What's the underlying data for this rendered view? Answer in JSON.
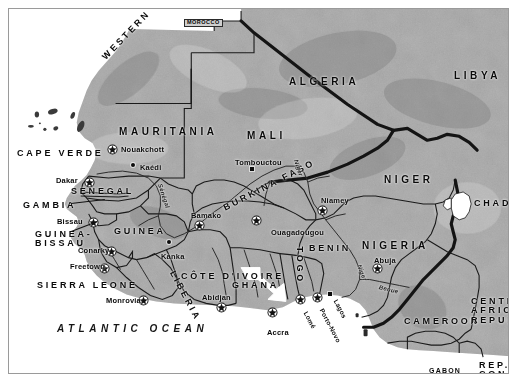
{
  "map": {
    "title": "West Africa Reference Map",
    "ocean_label": "ATLANTIC OCEAN",
    "colors": {
      "land": "#a9a9a9",
      "water": "#ffffff",
      "border": "#1a1a1a",
      "highlight": "#ffffff",
      "frame": "#9a9a9a",
      "text": "#0a0a0a"
    },
    "countries": [
      {
        "name": "MOROCCO",
        "x": 175,
        "y": 10,
        "style": "boxed"
      },
      {
        "name": "WESTERN SAHARA",
        "x": 95,
        "y": 45,
        "style": "rot",
        "rot": -46
      },
      {
        "name": "ALGERIA",
        "x": 280,
        "y": 68,
        "style": "big"
      },
      {
        "name": "LIBYA",
        "x": 445,
        "y": 62,
        "style": "big"
      },
      {
        "name": "MAURITANIA",
        "x": 110,
        "y": 118,
        "style": "big"
      },
      {
        "name": "MALI",
        "x": 238,
        "y": 122,
        "style": "big"
      },
      {
        "name": "NIGER",
        "x": 375,
        "y": 166,
        "style": "big"
      },
      {
        "name": "CHAD",
        "x": 465,
        "y": 190,
        "style": "med"
      },
      {
        "name": "CAPE VERDE",
        "x": 8,
        "y": 140,
        "style": "med"
      },
      {
        "name": "SENEGAL",
        "x": 62,
        "y": 178,
        "style": "med"
      },
      {
        "name": "GAMBIA",
        "x": 14,
        "y": 192,
        "style": "med"
      },
      {
        "name": "GUINEA-\nBISSAU",
        "x": 26,
        "y": 221,
        "style": "multiline"
      },
      {
        "name": "GUINEA",
        "x": 105,
        "y": 218,
        "style": "med"
      },
      {
        "name": "SIERRA LEONE",
        "x": 28,
        "y": 272,
        "style": "med"
      },
      {
        "name": "LIBERIA",
        "x": 163,
        "y": 258,
        "style": "rot",
        "rot": 62
      },
      {
        "name": "CÔTE D'IVOIRE",
        "x": 172,
        "y": 263,
        "style": "med"
      },
      {
        "name": "BURKINA FASO",
        "x": 215,
        "y": 195,
        "style": "rot",
        "rot": -27
      },
      {
        "name": "GHANA",
        "x": 223,
        "y": 272,
        "style": "med"
      },
      {
        "name": "TOGO",
        "x": 290,
        "y": 233,
        "style": "vert"
      },
      {
        "name": "BENIN",
        "x": 300,
        "y": 235,
        "style": "med"
      },
      {
        "name": "NIGERIA",
        "x": 353,
        "y": 232,
        "style": "big"
      },
      {
        "name": "CAMEROON",
        "x": 395,
        "y": 308,
        "style": "med"
      },
      {
        "name": "CENTRAL\nAFRICAN\nREPUBLIC",
        "x": 462,
        "y": 288,
        "style": "multiline"
      },
      {
        "name": "GABON",
        "x": 420,
        "y": 358,
        "style": "sm"
      },
      {
        "name": "REP. OF\nCONGO",
        "x": 470,
        "y": 352,
        "style": "multiline"
      }
    ],
    "cities": [
      {
        "name": "Nouakchott",
        "x": 112,
        "y": 137,
        "mx": 103,
        "my": 137,
        "type": "capital"
      },
      {
        "name": "Kaédi",
        "x": 131,
        "y": 155,
        "mx": 124,
        "my": 156,
        "type": "city"
      },
      {
        "name": "Dakar",
        "x": 47,
        "y": 168,
        "mx": 80,
        "my": 170,
        "type": "capital"
      },
      {
        "name": "Tombouctou",
        "x": 226,
        "y": 150,
        "mx": 243,
        "my": 160,
        "type": "city"
      },
      {
        "name": "Bissau",
        "x": 48,
        "y": 209,
        "mx": 84,
        "my": 210,
        "type": "capital"
      },
      {
        "name": "Bamako",
        "x": 182,
        "y": 203,
        "mx": 190,
        "my": 213,
        "type": "capital"
      },
      {
        "name": "Niamey",
        "x": 312,
        "y": 188,
        "mx": 313,
        "my": 198,
        "type": "capital"
      },
      {
        "name": "Ouagadougou",
        "x": 262,
        "y": 220,
        "mx": 247,
        "my": 208,
        "type": "capital"
      },
      {
        "name": "Conarky",
        "x": 69,
        "y": 238,
        "mx": 102,
        "my": 239,
        "type": "capital"
      },
      {
        "name": "Kanka",
        "x": 152,
        "y": 244,
        "mx": 160,
        "my": 233,
        "type": "city"
      },
      {
        "name": "Freetown",
        "x": 61,
        "y": 254,
        "mx": 95,
        "my": 256,
        "type": "capital"
      },
      {
        "name": "Abuja",
        "x": 365,
        "y": 248,
        "mx": 368,
        "my": 256,
        "type": "capital"
      },
      {
        "name": "Monrovia",
        "x": 97,
        "y": 288,
        "mx": 134,
        "my": 288,
        "type": "capital"
      },
      {
        "name": "Abidjan",
        "x": 193,
        "y": 285,
        "mx": 212,
        "my": 295,
        "type": "capital"
      },
      {
        "name": "Accra",
        "x": 258,
        "y": 320,
        "mx": 263,
        "my": 300,
        "type": "capital"
      },
      {
        "name": "Lomé",
        "x": 296,
        "y": 300,
        "mx": 291,
        "my": 287,
        "type": "capital"
      },
      {
        "name": "Porto-Novo",
        "x": 312,
        "y": 297,
        "mx": 308,
        "my": 285,
        "type": "capital"
      },
      {
        "name": "Lagos",
        "x": 326,
        "y": 288,
        "mx": 321,
        "my": 285,
        "type": "city"
      }
    ],
    "rivers": [
      {
        "name": "Sénégal",
        "x": 151,
        "y": 172,
        "rot": 72
      },
      {
        "name": "Niger",
        "x": 287,
        "y": 148,
        "rot": 72
      },
      {
        "name": "Niger",
        "x": 350,
        "y": 253,
        "rot": 68
      },
      {
        "name": "Benue",
        "x": 370,
        "y": 275,
        "rot": 14
      }
    ],
    "legend": {
      "capital_symbol": "star-in-circle",
      "city_symbol": "filled-dot"
    }
  }
}
